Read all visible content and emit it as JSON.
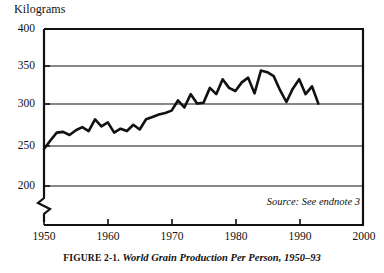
{
  "figure": {
    "caption_prefix": "FIGURE 2-1.",
    "caption_title": "World Grain Production Per Person, 1950–93",
    "source_note": "Source: See endnote 3"
  },
  "chart_data": {
    "type": "line",
    "title": "World Grain Production Per Person, 1950–93",
    "xlabel": "",
    "ylabel": "Kilograms",
    "ylim": [
      200,
      400
    ],
    "xlim": [
      1950,
      2000
    ],
    "yticks": [
      200,
      250,
      300,
      350,
      400
    ],
    "xticks": [
      1950,
      1960,
      1970,
      1980,
      1990,
      2000
    ],
    "ytick_labels": [
      "200",
      "250",
      "300",
      "350",
      "400"
    ],
    "xtick_labels": [
      "1950",
      "1960",
      "1970",
      "1980",
      "1990",
      "2000"
    ],
    "grid": true,
    "axis_break": true,
    "legend": null,
    "line_color": "#111111",
    "x": [
      1950,
      1951,
      1952,
      1953,
      1954,
      1955,
      1956,
      1957,
      1958,
      1959,
      1960,
      1961,
      1962,
      1963,
      1964,
      1965,
      1966,
      1967,
      1968,
      1969,
      1970,
      1971,
      1972,
      1973,
      1974,
      1975,
      1976,
      1977,
      1978,
      1979,
      1980,
      1981,
      1982,
      1983,
      1984,
      1985,
      1986,
      1987,
      1988,
      1989,
      1990,
      1991,
      1992,
      1993
    ],
    "values": [
      247,
      258,
      268,
      269,
      265,
      271,
      275,
      270,
      285,
      276,
      281,
      268,
      273,
      270,
      278,
      272,
      285,
      288,
      291,
      293,
      296,
      309,
      300,
      317,
      305,
      306,
      325,
      317,
      336,
      325,
      321,
      332,
      338,
      318,
      347,
      345,
      340,
      322,
      307,
      324,
      336,
      317,
      327,
      305
    ]
  }
}
